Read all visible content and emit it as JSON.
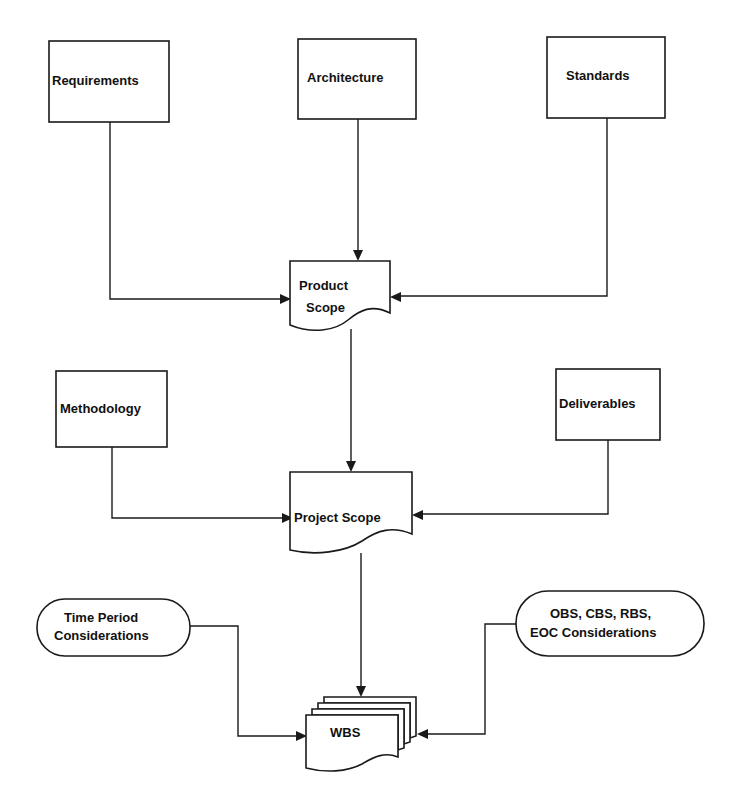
{
  "diagram": {
    "type": "flowchart",
    "nodes": {
      "requirements": {
        "label": "Requirements",
        "shape": "rectangle"
      },
      "architecture": {
        "label": "Architecture",
        "shape": "rectangle"
      },
      "standards": {
        "label": "Standards",
        "shape": "rectangle"
      },
      "product_scope": {
        "line1": "Product",
        "line2": "Scope",
        "shape": "document"
      },
      "methodology": {
        "label": "Methodology",
        "shape": "rectangle"
      },
      "deliverables": {
        "label": "Deliverables",
        "shape": "rectangle"
      },
      "project_scope": {
        "label": "Project  Scope",
        "shape": "document"
      },
      "time_period": {
        "line1": "Time  Period",
        "line2": "Considerations",
        "shape": "terminator"
      },
      "obs_cbs": {
        "line1": "OBS, CBS, RBS,",
        "line2": "EOC Considerations",
        "shape": "terminator"
      },
      "wbs": {
        "label": "WBS",
        "shape": "multi-document"
      }
    },
    "edges": [
      {
        "from": "Requirements",
        "to": "Product Scope"
      },
      {
        "from": "Architecture",
        "to": "Product Scope"
      },
      {
        "from": "Standards",
        "to": "Product Scope"
      },
      {
        "from": "Product Scope",
        "to": "Project Scope"
      },
      {
        "from": "Methodology",
        "to": "Project Scope"
      },
      {
        "from": "Deliverables",
        "to": "Project Scope"
      },
      {
        "from": "Project Scope",
        "to": "WBS"
      },
      {
        "from": "Time Period Considerations",
        "to": "WBS"
      },
      {
        "from": "OBS, CBS, RBS, EOC Considerations",
        "to": "WBS"
      }
    ],
    "colors": {
      "stroke": "#1a1a1a",
      "fill": "#ffffff",
      "text": "#111111"
    }
  }
}
